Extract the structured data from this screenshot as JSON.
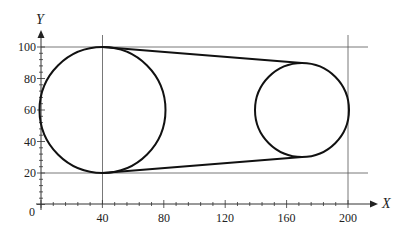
{
  "diagram": {
    "x_axis_label": "X",
    "y_axis_label": "Y",
    "origin_label": "0",
    "x_ticks": [
      {
        "v": 40,
        "label": "40"
      },
      {
        "v": 80,
        "label": "80"
      },
      {
        "v": 120,
        "label": "120"
      },
      {
        "v": 160,
        "label": "160"
      },
      {
        "v": 200,
        "label": "200"
      }
    ],
    "y_ticks": [
      {
        "v": 20,
        "label": "20"
      },
      {
        "v": 40,
        "label": "40"
      },
      {
        "v": 60,
        "label": "60"
      },
      {
        "v": 80,
        "label": "80"
      },
      {
        "v": 100,
        "label": "100"
      }
    ],
    "circles": [
      {
        "name": "large-circle",
        "cx": 40,
        "cy": 60,
        "r": 40
      },
      {
        "name": "small-circle",
        "cx": 170,
        "cy": 60,
        "r": 30
      }
    ],
    "guide_lines": {
      "horizontal": [
        100,
        20
      ],
      "vertical": [
        40,
        200
      ]
    },
    "tangent_lines": [
      {
        "from": [
          40,
          100
        ],
        "to": [
          170,
          90
        ]
      },
      {
        "from": [
          40,
          20
        ],
        "to": [
          170,
          30
        ]
      }
    ]
  }
}
